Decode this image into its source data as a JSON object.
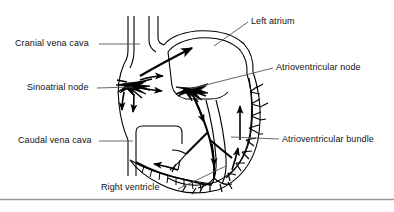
{
  "figure": {
    "background_color": "#ffffff",
    "line_color": "#000000",
    "text_color": "#111111"
  },
  "labels": {
    "cranial_vena_cava": "Cranial vena cava",
    "sinoatrial_node": "Sinoatrial node",
    "caudal_vena_cava": "Caudal vena cava",
    "left_atrium": "Left atrium",
    "atrioventricular_node": "Atrioventricular node",
    "atrioventricular_bundle": "Atrioventricular bundle",
    "right_ventricle": "Right ventricle"
  },
  "diagram": {
    "type": "anatomical-line-drawing",
    "features": [
      "cranial vena cava entering right atrium from above",
      "caudal vena cava entering right atrium from below",
      "sinoatrial node as dark branching cluster in right atrial wall",
      "radiating arrows showing impulse spread across atria",
      "atrioventricular node at base of interatrial septum",
      "atrioventricular bundle descending in interventricular septum",
      "Purkinje fibre networks branching through ventricular walls",
      "arrows indicating upward conduction in ventricular walls"
    ],
    "footer_rule": true
  }
}
